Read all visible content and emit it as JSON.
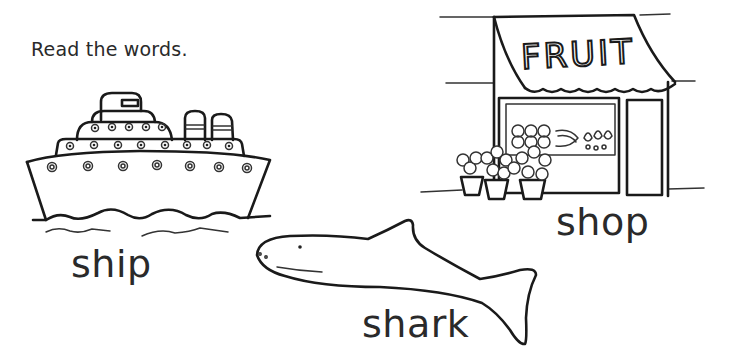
{
  "worksheet": {
    "instruction": "Read the words.",
    "items": [
      {
        "word": "ship",
        "picture": "ship-illustration"
      },
      {
        "word": "shop",
        "picture": "fruit-shop-illustration",
        "sign": "FRUIT"
      },
      {
        "word": "shark",
        "picture": "shark-illustration"
      }
    ]
  },
  "colors": {
    "ink": "#1a1a1a",
    "background": "#ffffff"
  }
}
